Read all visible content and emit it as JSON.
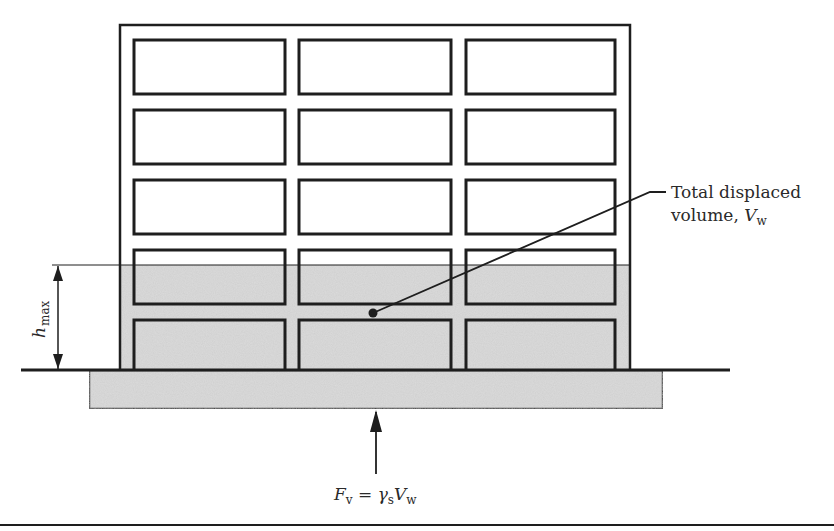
{
  "figure": {
    "type": "building-buoyancy-diagram",
    "stroke_color": "#1e1e1e",
    "fill_color": "#d9d9d9",
    "background": "#ffffff"
  },
  "building": {
    "floors": 5,
    "columns": 3,
    "window_rows": [
      {
        "top": 40,
        "bottom": 94
      },
      {
        "top": 110,
        "bottom": 164
      },
      {
        "top": 180,
        "bottom": 234
      },
      {
        "top": 250,
        "bottom": 304
      },
      {
        "top": 320,
        "bottom": 370
      }
    ],
    "window_cols": [
      {
        "left": 134,
        "right": 285
      },
      {
        "left": 299,
        "right": 451
      },
      {
        "left": 466,
        "right": 615
      }
    ]
  },
  "labels": {
    "displaced_volume_line1": "Total displaced",
    "displaced_volume_line2": "volume, ",
    "displaced_volume_symbol": "V",
    "displaced_volume_subscript": "w",
    "h_max_symbol": "h",
    "h_max_subscript": "max",
    "force_lhs_symbol": "F",
    "force_lhs_subscript": "v",
    "force_equals": " = ",
    "force_gamma": "γ",
    "force_gamma_subscript": "s",
    "force_rhs_symbol": "V",
    "force_rhs_subscript": "w"
  }
}
